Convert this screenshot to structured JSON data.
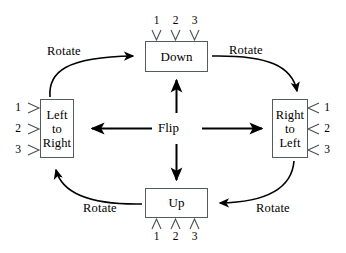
{
  "diagram": {
    "type": "state-transition-cycle",
    "nodes": [
      {
        "id": "down",
        "label": "Down",
        "position": "top"
      },
      {
        "id": "right_to_left",
        "label": "Right\nto\nLeft",
        "position": "right"
      },
      {
        "id": "up",
        "label": "Up",
        "position": "bottom"
      },
      {
        "id": "left_to_right",
        "label": "Left\nto\nRight",
        "position": "left"
      }
    ],
    "center_label": "Flip",
    "edges": [
      {
        "id": "rotate-left-to-down",
        "label": "Rotate",
        "from": "left_to_right",
        "to": "down",
        "style": "curved"
      },
      {
        "id": "rotate-down-to-right",
        "label": "Rotate",
        "from": "down",
        "to": "right_to_left",
        "style": "curved"
      },
      {
        "id": "rotate-right-to-up",
        "label": "Rotate",
        "from": "right_to_left",
        "to": "up",
        "style": "curved"
      },
      {
        "id": "rotate-up-to-left",
        "label": "Rotate",
        "from": "up",
        "to": "left_to_right",
        "style": "curved"
      },
      {
        "id": "flip-up",
        "label": "Flip",
        "from": "center",
        "to": "down",
        "style": "straight"
      },
      {
        "id": "flip-right",
        "label": "Flip",
        "from": "center",
        "to": "right_to_left",
        "style": "straight"
      },
      {
        "id": "flip-down",
        "label": "Flip",
        "from": "center",
        "to": "up",
        "style": "straight"
      },
      {
        "id": "flip-left",
        "label": "Flip",
        "from": "center",
        "to": "left_to_right",
        "style": "straight"
      }
    ],
    "tick_labels": {
      "down": [
        "1",
        "2",
        "3"
      ],
      "up": [
        "1",
        "2",
        "3"
      ],
      "left_to_right": [
        "1",
        "2",
        "3"
      ],
      "right_to_left": [
        "1",
        "2",
        "3"
      ]
    },
    "colors": {
      "stroke": "#000000",
      "box_border": "#555a5e",
      "background": "#ffffff",
      "tick": "#4a4f53"
    }
  }
}
